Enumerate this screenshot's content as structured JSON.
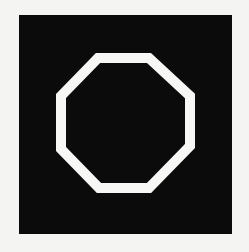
{
  "figure": {
    "background_color": "#f4f4f2",
    "square": {
      "color": "#0b0b0b"
    },
    "shape": {
      "type": "octagon",
      "style": "outline",
      "stroke_color": "#f7f7f5",
      "fill": "none"
    }
  }
}
